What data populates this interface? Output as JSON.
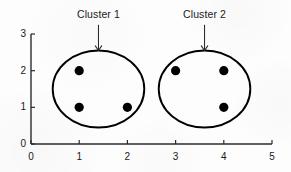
{
  "chart_data": {
    "type": "scatter",
    "title": "",
    "subtitle": "",
    "xlabel": "",
    "ylabel": "",
    "xlim": [
      0,
      5
    ],
    "ylim": [
      0,
      3
    ],
    "x_ticks": [
      0,
      1,
      2,
      3,
      4,
      5
    ],
    "y_ticks": [
      0,
      1,
      2,
      3
    ],
    "x_tick_labels": [
      "0",
      "1",
      "2",
      "3",
      "4",
      "5"
    ],
    "y_tick_labels": [
      "0",
      "1",
      "2",
      "3"
    ],
    "grid": false,
    "legend": "none",
    "series": [
      {
        "name": "Cluster 1",
        "marker": "filled-circle",
        "color": "#000000",
        "points": [
          {
            "x": 1,
            "y": 2
          },
          {
            "x": 1,
            "y": 1
          },
          {
            "x": 2,
            "y": 1
          }
        ]
      },
      {
        "name": "Cluster 2",
        "marker": "filled-circle",
        "color": "#000000",
        "points": [
          {
            "x": 3,
            "y": 2
          },
          {
            "x": 4,
            "y": 2
          },
          {
            "x": 4,
            "y": 1
          }
        ]
      }
    ],
    "enclosures": [
      {
        "label": "Cluster 1",
        "shape": "ellipse",
        "center": {
          "x": 1.4,
          "y": 1.5
        },
        "radius": {
          "x": 0.95,
          "y": 1.05
        }
      },
      {
        "label": "Cluster 2",
        "shape": "ellipse",
        "center": {
          "x": 3.6,
          "y": 1.5
        },
        "radius": {
          "x": 0.95,
          "y": 1.05
        }
      }
    ],
    "annotations": [
      {
        "text": "Cluster 1",
        "label_at": {
          "x": 1.4,
          "y": 3.45
        },
        "arrow_from": {
          "x": 1.4,
          "y": 3.25
        },
        "arrow_to": {
          "x": 1.4,
          "y": 2.55
        },
        "arrow_style": "down-arrow"
      },
      {
        "text": "Cluster 2",
        "label_at": {
          "x": 3.6,
          "y": 3.45
        },
        "arrow_from": {
          "x": 3.6,
          "y": 3.25
        },
        "arrow_to": {
          "x": 3.6,
          "y": 2.55
        },
        "arrow_style": "down-arrow"
      }
    ],
    "colors": {
      "point": "#000000",
      "axis": "#2b2b2b",
      "ellipse": "#000000",
      "arrow": "#2b2b2b",
      "text": "#1a1a1a",
      "background": "#fdfdfd"
    }
  }
}
